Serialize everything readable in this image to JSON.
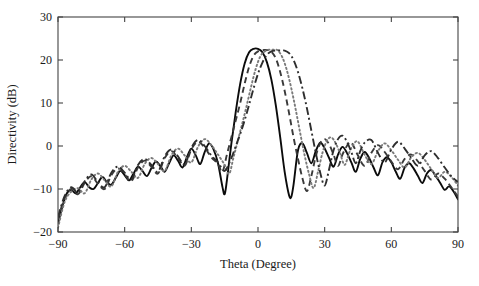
{
  "chart_data": {
    "type": "line",
    "title": "",
    "xlabel": "Theta (Degree)",
    "ylabel": "Directivity (dB)",
    "xlim": [
      -90,
      90
    ],
    "ylim": [
      -20,
      30
    ],
    "xticks": [
      -90,
      -60,
      -30,
      0,
      30,
      60,
      90
    ],
    "xtick_labels": [
      "−90",
      "−60",
      "−30",
      "0",
      "30",
      "60",
      "90"
    ],
    "yticks": [
      -20,
      -10,
      0,
      10,
      20,
      30
    ],
    "ytick_labels": [
      "−20",
      "−10",
      "0",
      "10",
      "20",
      "30"
    ],
    "grid": false,
    "legend": "none",
    "series": [
      {
        "name": "solid",
        "style": "solid",
        "color": "#0b0b0b",
        "peak_theta": 0,
        "peak_value": 22.6,
        "x": [
          -90,
          -88,
          -86,
          -84,
          -82,
          -80,
          -78,
          -76,
          -74,
          -72,
          -70,
          -68,
          -66,
          -64,
          -62,
          -60,
          -58,
          -56,
          -54,
          -52,
          -50,
          -48,
          -46,
          -44,
          -42,
          -40,
          -38,
          -36,
          -34,
          -32,
          -30,
          -28,
          -26,
          -24,
          -22,
          -20,
          -18,
          -16,
          -15,
          -14,
          -12,
          -10,
          -8,
          -6,
          -4,
          -2,
          0,
          2,
          4,
          6,
          8,
          10,
          12,
          14,
          15,
          16,
          18,
          20,
          22,
          24,
          26,
          28,
          30,
          32,
          34,
          36,
          38,
          40,
          42,
          44,
          46,
          48,
          50,
          52,
          54,
          56,
          58,
          60,
          62,
          64,
          66,
          68,
          70,
          72,
          74,
          76,
          78,
          80,
          82,
          84,
          86,
          88,
          90
        ],
        "y": [
          -18.0,
          -14.0,
          -11.0,
          -10.2,
          -11.0,
          -9.6,
          -8.4,
          -9.6,
          -10.0,
          -8.6,
          -7.2,
          -8.4,
          -9.0,
          -7.4,
          -5.8,
          -6.8,
          -8.0,
          -6.4,
          -4.8,
          -5.8,
          -7.0,
          -5.2,
          -3.6,
          -4.6,
          -6.0,
          -4.0,
          -2.2,
          -3.4,
          -5.0,
          -2.6,
          -0.6,
          -2.2,
          -4.2,
          -1.4,
          0.6,
          -0.8,
          -4.0,
          -9.5,
          -11.2,
          -8.0,
          0.5,
          8.0,
          14.5,
          19.2,
          21.8,
          22.6,
          22.6,
          21.8,
          19.5,
          15.5,
          9.5,
          2.0,
          -6.0,
          -11.5,
          -11.8,
          -9.0,
          -1.0,
          0.6,
          -1.6,
          -4.0,
          -1.2,
          0.8,
          -0.6,
          -2.8,
          -4.8,
          -2.0,
          -0.2,
          -1.6,
          -3.8,
          -6.0,
          -3.0,
          -1.4,
          -2.8,
          -5.0,
          -6.8,
          -3.8,
          -2.6,
          -3.8,
          -6.0,
          -7.6,
          -5.0,
          -4.0,
          -5.2,
          -7.0,
          -8.6,
          -6.4,
          -5.6,
          -7.0,
          -8.6,
          -10.2,
          -9.4,
          -10.6,
          -12.4
        ]
      },
      {
        "name": "dashed",
        "style": "dashed",
        "color": "#3a3a3a",
        "peak_theta": 5,
        "peak_value": 22.3,
        "x": [
          -90,
          -87,
          -84,
          -81,
          -78,
          -75,
          -72,
          -69,
          -66,
          -63,
          -60,
          -57,
          -54,
          -51,
          -48,
          -45,
          -42,
          -39,
          -36,
          -33,
          -30,
          -27,
          -24,
          -21,
          -18,
          -16,
          -14,
          -12,
          -10,
          -8,
          -6,
          -4,
          -2,
          0,
          2,
          4,
          5,
          6,
          8,
          10,
          12,
          14,
          16,
          18,
          20,
          22,
          24,
          26,
          28,
          30,
          32,
          34,
          36,
          38,
          40,
          42,
          45,
          48,
          51,
          54,
          57,
          60,
          63,
          66,
          69,
          72,
          75,
          78,
          81,
          84,
          87,
          90
        ],
        "y": [
          -17.0,
          -12.0,
          -10.0,
          -11.2,
          -8.6,
          -7.0,
          -8.8,
          -10.0,
          -6.8,
          -5.2,
          -6.6,
          -8.2,
          -5.0,
          -3.4,
          -4.8,
          -6.4,
          -2.8,
          -1.2,
          -2.8,
          -4.6,
          -0.8,
          1.0,
          -0.4,
          -2.6,
          -4.2,
          -6.0,
          -2.0,
          2.0,
          6.0,
          10.0,
          14.5,
          18.4,
          21.0,
          22.0,
          22.3,
          22.3,
          22.3,
          22.0,
          20.4,
          17.2,
          12.8,
          7.6,
          2.0,
          -3.0,
          -7.5,
          -10.5,
          -7.0,
          -2.4,
          0.6,
          1.6,
          0.4,
          -2.0,
          -4.6,
          -2.0,
          0.0,
          0.8,
          -2.2,
          -4.6,
          -1.6,
          0.2,
          -1.4,
          -3.6,
          -5.4,
          -3.0,
          -2.0,
          -3.6,
          -5.8,
          -7.8,
          -6.4,
          -7.6,
          -9.6,
          -11.8
        ]
      },
      {
        "name": "dotted",
        "style": "dotted",
        "color": "#7a7a7a",
        "peak_theta": 8,
        "peak_value": 22.4,
        "x": [
          -90,
          -87,
          -84,
          -81,
          -78,
          -75,
          -72,
          -69,
          -66,
          -63,
          -60,
          -57,
          -54,
          -51,
          -48,
          -45,
          -42,
          -39,
          -36,
          -33,
          -30,
          -27,
          -24,
          -21,
          -18,
          -15,
          -13,
          -11,
          -9,
          -7,
          -5,
          -3,
          -1,
          1,
          3,
          5,
          7,
          8,
          9,
          11,
          13,
          15,
          17,
          19,
          21,
          23,
          25,
          27,
          29,
          31,
          33,
          35,
          37,
          39,
          41,
          43,
          45,
          48,
          51,
          54,
          57,
          60,
          63,
          66,
          69,
          72,
          75,
          78,
          81,
          84,
          87,
          90
        ],
        "y": [
          -19.0,
          -13.0,
          -10.6,
          -9.8,
          -11.0,
          -7.8,
          -6.4,
          -8.0,
          -9.4,
          -6.0,
          -4.6,
          -6.0,
          -7.4,
          -4.2,
          -2.8,
          -4.2,
          -5.8,
          -2.2,
          -0.6,
          -2.2,
          -3.8,
          -0.2,
          1.6,
          0.2,
          -2.0,
          -4.4,
          -6.5,
          -2.6,
          1.4,
          5.4,
          9.6,
          14.0,
          18.0,
          20.8,
          22.0,
          22.4,
          22.4,
          22.4,
          22.2,
          20.6,
          17.6,
          13.4,
          8.4,
          3.0,
          -2.2,
          -6.6,
          -9.8,
          -6.0,
          -1.6,
          1.2,
          2.0,
          0.6,
          -1.8,
          -4.4,
          -1.6,
          0.4,
          1.0,
          -2.0,
          -4.2,
          -1.2,
          0.6,
          -1.0,
          -3.2,
          -5.0,
          -2.6,
          -1.6,
          -3.2,
          -5.4,
          -7.4,
          -6.0,
          -7.2,
          -9.2
        ]
      },
      {
        "name": "dash-dot",
        "style": "dashdot",
        "color": "#2e2e2e",
        "peak_theta": 12,
        "peak_value": 22.2,
        "x": [
          -90,
          -87,
          -84,
          -81,
          -78,
          -75,
          -72,
          -69,
          -66,
          -63,
          -60,
          -57,
          -54,
          -51,
          -48,
          -45,
          -42,
          -39,
          -36,
          -33,
          -30,
          -27,
          -24,
          -21,
          -18,
          -15,
          -12,
          -10,
          -8,
          -6,
          -4,
          -2,
          0,
          2,
          4,
          6,
          8,
          10,
          12,
          14,
          16,
          18,
          20,
          22,
          24,
          26,
          28,
          30,
          32,
          34,
          36,
          38,
          40,
          42,
          44,
          46,
          48,
          51,
          54,
          57,
          60,
          63,
          66,
          69,
          72,
          75,
          78,
          81,
          84,
          87,
          90
        ],
        "y": [
          -16.5,
          -11.6,
          -9.6,
          -10.8,
          -8.2,
          -6.6,
          -8.4,
          -9.6,
          -6.2,
          -4.8,
          -6.2,
          -7.8,
          -4.4,
          -3.0,
          -4.4,
          -6.0,
          -2.4,
          -0.8,
          -2.4,
          -4.2,
          -0.4,
          1.4,
          0.0,
          -2.2,
          -3.8,
          -5.8,
          -2.8,
          0.0,
          2.8,
          6.0,
          9.6,
          13.4,
          16.8,
          19.4,
          21.2,
          22.0,
          22.2,
          22.2,
          22.2,
          21.6,
          20.0,
          17.2,
          13.4,
          8.8,
          3.6,
          -1.6,
          -6.2,
          -9.2,
          -5.4,
          -1.0,
          1.6,
          2.4,
          1.0,
          -1.4,
          -4.0,
          -1.2,
          0.8,
          1.4,
          -1.6,
          -3.8,
          -0.8,
          1.0,
          -0.6,
          -2.8,
          -4.6,
          -2.2,
          -1.2,
          -2.8,
          -5.0,
          -7.0,
          -8.4
        ]
      }
    ]
  },
  "figure": {
    "background_color": "#ffffff",
    "axis_color": "#444444"
  }
}
